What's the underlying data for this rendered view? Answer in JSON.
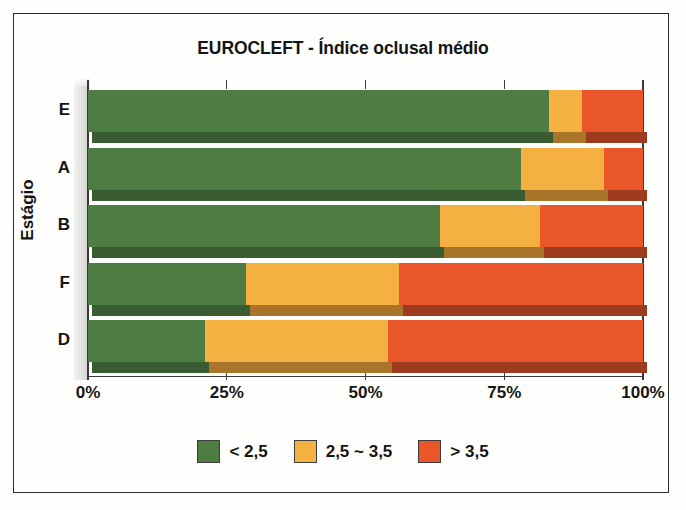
{
  "chart_data": {
    "type": "bar",
    "orientation": "horizontal",
    "stacked": true,
    "normalized_percent": true,
    "title": "EUROCLEFT - Índice oclusal médio",
    "xlabel": "",
    "ylabel": "Estágio",
    "xlim": [
      0,
      100
    ],
    "xticks": [
      0,
      25,
      50,
      75,
      100
    ],
    "xtick_labels": [
      "0%",
      "25%",
      "50%",
      "75%",
      "100%"
    ],
    "grid": false,
    "legend_position": "bottom",
    "categories": [
      "E",
      "A",
      "B",
      "F",
      "D"
    ],
    "series": [
      {
        "name": "< 2,5",
        "color": "#4e7d44",
        "values": [
          83.0,
          78.0,
          63.5,
          28.5,
          21.0
        ]
      },
      {
        "name": "2,5 ~ 3,5",
        "color": "#f5b042",
        "values": [
          6.0,
          15.0,
          18.0,
          27.5,
          33.0
        ]
      },
      {
        "name": "> 3,5",
        "color": "#e8562a",
        "values": [
          11.0,
          7.0,
          18.5,
          44.0,
          46.0
        ]
      }
    ],
    "cumulative_boundaries": {
      "E": [
        83.0,
        89.0,
        100.0
      ],
      "A": [
        78.0,
        93.0,
        100.0
      ],
      "B": [
        63.5,
        81.5,
        100.0
      ],
      "F": [
        28.5,
        56.0,
        100.0
      ],
      "D": [
        21.0,
        54.0,
        100.0
      ]
    }
  },
  "title": {
    "text": "EUROCLEFT - Índice oclusal médio"
  },
  "axes": {
    "y_title": "Estágio",
    "y_categories": [
      "E",
      "A",
      "B",
      "F",
      "D"
    ],
    "x_tick_labels": [
      "0%",
      "25%",
      "50%",
      "75%",
      "100%"
    ]
  },
  "legend": {
    "items": [
      {
        "label": "< 2,5",
        "color": "#4e7d44"
      },
      {
        "label": "2,5 ~ 3,5",
        "color": "#f5b042"
      },
      {
        "label": "> 3,5",
        "color": "#e8562a"
      }
    ]
  },
  "colors": {
    "green": "#4e7d44",
    "orange": "#f5b042",
    "red": "#e8562a",
    "green_shadow": "#3a5c32",
    "orange_shadow": "#a8752a",
    "red_shadow": "#9c3b1d",
    "axis": "#3a3a3a",
    "text": "#141414",
    "frame": "#2b2b2b",
    "background": "#fefefc"
  }
}
